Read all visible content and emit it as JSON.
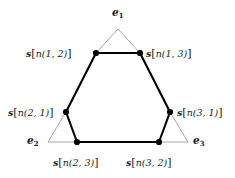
{
  "figure": {
    "name": "triangle-hexagon-node-diagram",
    "background_color": "#ffffff",
    "outer_edge_color": "#9a9a9a",
    "inner_edge_color": "#000000",
    "node_color": "#000000",
    "vertices": [
      {
        "id": "e1",
        "label": "e",
        "subscript": "1",
        "x": 118,
        "y": 29
      },
      {
        "id": "e2",
        "label": "e",
        "subscript": "2",
        "x": 48,
        "y": 142
      },
      {
        "id": "e3",
        "label": "e",
        "subscript": "3",
        "x": 188,
        "y": 142
      }
    ],
    "vertex_labels": [
      {
        "id": "e1-label",
        "text": "e",
        "sub": "1",
        "x": 113,
        "y": 8
      },
      {
        "id": "e2-label",
        "text": "e",
        "sub": "2",
        "x": 28,
        "y": 136
      },
      {
        "id": "e3-label",
        "text": "e",
        "sub": "3",
        "x": 194,
        "y": 136
      }
    ],
    "nodes": [
      {
        "id": "n12",
        "symbol": "s",
        "arg": "n(1, 2)",
        "x": 96,
        "y": 53
      },
      {
        "id": "n13",
        "symbol": "s",
        "arg": "n(1, 3)",
        "x": 140,
        "y": 53
      },
      {
        "id": "n21",
        "symbol": "s",
        "arg": "n(2, 1)",
        "x": 66,
        "y": 112
      },
      {
        "id": "n31",
        "symbol": "s",
        "arg": "n(3, 1)",
        "x": 170,
        "y": 112
      },
      {
        "id": "n23",
        "symbol": "s",
        "arg": "n(2, 3)",
        "x": 77,
        "y": 142
      },
      {
        "id": "n32",
        "symbol": "s",
        "arg": "n(3, 2)",
        "x": 159,
        "y": 142
      }
    ],
    "node_labels": {
      "n12": {
        "symbol": "s",
        "open": "[",
        "arg": "n(1, 2)",
        "close": "]"
      },
      "n13": {
        "symbol": "s",
        "open": "[",
        "arg": "n(1, 3)",
        "close": "]"
      },
      "n21": {
        "symbol": "s",
        "open": "[",
        "arg": "n(2, 1)",
        "close": "]"
      },
      "n31": {
        "symbol": "s",
        "open": "[",
        "arg": "n(3, 1)",
        "close": "]"
      },
      "n23": {
        "symbol": "s",
        "open": "[",
        "arg": "n(2, 3)",
        "close": "]"
      },
      "n32": {
        "symbol": "s",
        "open": "[",
        "arg": "n(3, 2)",
        "close": "]"
      }
    },
    "hexagon_edges": [
      [
        "n12",
        "n13"
      ],
      [
        "n13",
        "n31"
      ],
      [
        "n31",
        "n32"
      ],
      [
        "n32",
        "n23"
      ],
      [
        "n23",
        "n21"
      ],
      [
        "n21",
        "n12"
      ]
    ],
    "corner_edges": [
      [
        "e1",
        "n12"
      ],
      [
        "e1",
        "n13"
      ],
      [
        "e2",
        "n21"
      ],
      [
        "e2",
        "n23"
      ],
      [
        "e3",
        "n31"
      ],
      [
        "e3",
        "n32"
      ]
    ]
  }
}
